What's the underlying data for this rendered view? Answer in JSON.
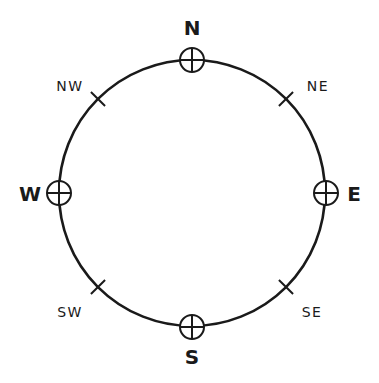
{
  "diagram": {
    "circle": {
      "cx": 192,
      "cy": 193,
      "r": 133,
      "stroke": "#1a1a1a"
    },
    "cardinals": [
      {
        "label": "N",
        "x": 192,
        "y": 60,
        "lx": 192,
        "ly": 35
      },
      {
        "label": "E",
        "x": 326,
        "y": 193,
        "lx": 354,
        "ly": 201
      },
      {
        "label": "S",
        "x": 192,
        "y": 327,
        "lx": 192,
        "ly": 364
      },
      {
        "label": "W",
        "x": 59,
        "y": 193,
        "lx": 30,
        "ly": 201
      }
    ],
    "intercardinals": [
      {
        "label": "NE",
        "x": 286,
        "y": 99,
        "lx": 318,
        "ly": 91
      },
      {
        "label": "SE",
        "x": 286,
        "y": 287,
        "lx": 312,
        "ly": 317
      },
      {
        "label": "SW",
        "x": 98,
        "y": 287,
        "lx": 70,
        "ly": 317
      },
      {
        "label": "NW",
        "x": 98,
        "y": 99,
        "lx": 70,
        "ly": 91
      }
    ]
  }
}
